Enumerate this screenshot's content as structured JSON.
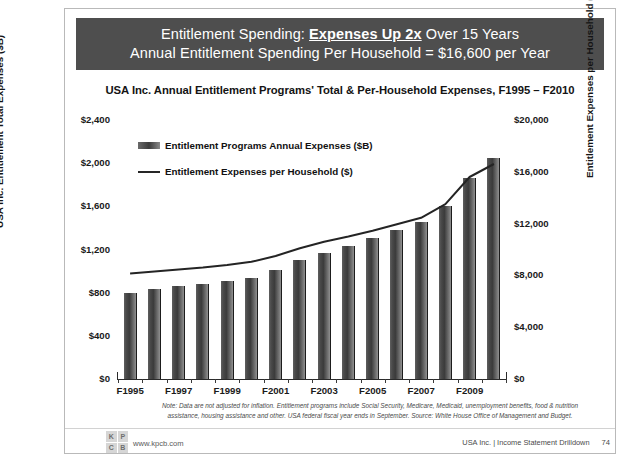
{
  "banner": {
    "line1_pre": "Entitlement Spending: ",
    "line1_bold": "Expenses Up 2x",
    "line1_post": " Over 15 Years",
    "line2": "Annual Entitlement Spending Per Household = $16,600 per Year"
  },
  "legend": {
    "bars": "Entitlement Programs Annual Expenses ($B)",
    "line": "Entitlement Expenses per Household ($)"
  },
  "footnote": {
    "line1": "Note: Data are not adjusted for inflation. Entitlement programs include Social Security, Medicare, Medicaid,",
    "line2": "unemployment benefits, food & nutrition assistance, housing assistance and other. USA federal fiscal year ends in",
    "line3": "September. Source: White House Office of Management and Budget."
  },
  "footer": {
    "logo_letters": [
      "K",
      "P",
      "C",
      "B"
    ],
    "url": "www.kpcb.com",
    "deck": "USA Inc. | Income Statement Drilldown",
    "page": "74"
  },
  "chart_data": {
    "type": "bar",
    "title": "USA Inc. Annual Entitlement Programs' Total & Per-Household Expenses, F1995 – F2010",
    "xlabel": "",
    "ylabel": "USA Inc. Entitlement Total Expenses ($B)",
    "y2label": "Entitlement Expenses per Household ($)",
    "grid": false,
    "legend_position": "upper-left-inside",
    "categories": [
      "F1995",
      "F1996",
      "F1997",
      "F1998",
      "F1999",
      "F2000",
      "F2001",
      "F2002",
      "F2003",
      "F2004",
      "F2005",
      "F2006",
      "F2007",
      "F2008",
      "F2009",
      "F2010"
    ],
    "xtick_labels": [
      "F1995",
      "F1997",
      "F1999",
      "F2001",
      "F2003",
      "F2005",
      "F2007",
      "F2009"
    ],
    "ylim": [
      0,
      2400
    ],
    "yticks": [
      0,
      400,
      800,
      1200,
      1600,
      2000,
      2400
    ],
    "ytick_labels": [
      "$0",
      "$400",
      "$800",
      "$1,200",
      "$1,600",
      "$2,000",
      "$2,400"
    ],
    "y2lim": [
      0,
      20000
    ],
    "y2ticks": [
      0,
      4000,
      8000,
      12000,
      16000,
      20000
    ],
    "y2tick_labels": [
      "$0",
      "$4,000",
      "$8,000",
      "$12,000",
      "$16,000",
      "$20,000"
    ],
    "series": [
      {
        "name": "Entitlement Programs Annual Expenses ($B)",
        "type": "bar",
        "axis": "left",
        "values": [
          795,
          835,
          860,
          880,
          905,
          940,
          1010,
          1100,
          1170,
          1235,
          1305,
          1385,
          1455,
          1600,
          1860,
          2050
        ]
      },
      {
        "name": "Entitlement Expenses per Household ($)",
        "type": "line",
        "axis": "right",
        "values": [
          8150,
          8300,
          8450,
          8600,
          8800,
          9050,
          9500,
          10100,
          10600,
          11000,
          11450,
          11950,
          12450,
          13500,
          15600,
          16600
        ]
      }
    ]
  }
}
